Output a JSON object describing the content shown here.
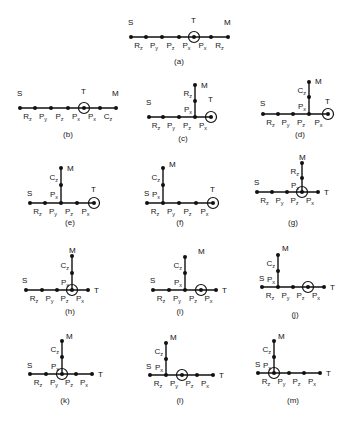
{
  "figures": [
    {
      "id": "a",
      "caption": "(a)",
      "y": 37,
      "xs": [
        131,
        146,
        162,
        179,
        194,
        211,
        228
      ],
      "target_index": 4,
      "labels": [
        [
          "R",
          "z"
        ],
        [
          "P",
          "y"
        ],
        [
          "P",
          "z"
        ],
        [
          "P",
          "x"
        ],
        [
          "P",
          "x"
        ],
        [
          "R",
          "z"
        ]
      ],
      "S": [
        128,
        25
      ],
      "T": [
        191,
        23
      ],
      "M": [
        224,
        25
      ],
      "cap_pos": [
        179,
        64
      ],
      "vertical": null
    },
    {
      "id": "b",
      "caption": "(b)",
      "y": 108,
      "xs": [
        20,
        35,
        51,
        68,
        84,
        100,
        116
      ],
      "target_index": 4,
      "labels": [
        [
          "R",
          "z"
        ],
        [
          "P",
          "y"
        ],
        [
          "P",
          "z"
        ],
        [
          "P",
          "x"
        ],
        [
          "P",
          "x"
        ],
        [
          "C",
          "z"
        ]
      ],
      "S": [
        17,
        96
      ],
      "T": [
        81,
        94
      ],
      "M": [
        112,
        96
      ],
      "cap_pos": [
        68,
        137
      ],
      "vertical": null
    },
    {
      "id": "c",
      "caption": "(c)",
      "y": 117,
      "xs": [
        149,
        163,
        179,
        195,
        211
      ],
      "target_index": 4,
      "labels": [
        [
          "R",
          "z"
        ],
        [
          "P",
          "y"
        ],
        [
          "P",
          "z"
        ],
        [
          "P",
          "x"
        ]
      ],
      "S": [
        146,
        105
      ],
      "T": [
        208,
        102
      ],
      "M": [
        201,
        88
      ],
      "cap_pos": [
        183,
        141
      ],
      "vertical": {
        "x": 195,
        "ys": [
          117,
          101,
          85
        ],
        "labels": [
          [
            "P",
            "x"
          ],
          [
            "R",
            "z"
          ]
        ]
      }
    },
    {
      "id": "d",
      "caption": "(d)",
      "y": 114,
      "xs": [
        263,
        278,
        293,
        309,
        328
      ],
      "target_index": 4,
      "labels": [
        [
          "R",
          "z"
        ],
        [
          "P",
          "y"
        ],
        [
          "P",
          "z"
        ],
        [
          "P",
          "x"
        ]
      ],
      "S": [
        260,
        106
      ],
      "T": [
        325,
        104
      ],
      "M": [
        315,
        84
      ],
      "cap_pos": [
        300,
        137
      ],
      "vertical": {
        "x": 309,
        "ys": [
          114,
          97,
          82
        ],
        "labels": [
          [
            "P",
            "x"
          ],
          [
            "C",
            "z"
          ]
        ]
      }
    },
    {
      "id": "e",
      "caption": "(e)",
      "y": 203,
      "xs": [
        30,
        45,
        61,
        77,
        94
      ],
      "target_index": 4,
      "labels": [
        [
          "R",
          "z"
        ],
        [
          "P",
          "y"
        ],
        [
          "P",
          "z"
        ],
        [
          "P",
          "x"
        ]
      ],
      "S": [
        27,
        196
      ],
      "T": [
        91,
        192
      ],
      "M": [
        67,
        171
      ],
      "cap_pos": [
        70,
        225
      ],
      "vertical": {
        "x": 61,
        "ys": [
          203,
          185,
          168
        ],
        "labels": [
          [
            "P",
            "x"
          ],
          [
            "C",
            "z"
          ]
        ]
      }
    },
    {
      "id": "f",
      "caption": "(f)",
      "y": 203,
      "xs": [
        147,
        163,
        179,
        196,
        213
      ],
      "target_index": 4,
      "labels": [
        [
          "R",
          "z"
        ],
        [
          "P",
          "y"
        ],
        [
          "P",
          "z"
        ],
        [
          "P",
          "x"
        ]
      ],
      "S": [
        144,
        196
      ],
      "T": [
        210,
        192
      ],
      "M": [
        169,
        167
      ],
      "cap_pos": [
        180,
        225
      ],
      "vertical": {
        "x": 163,
        "ys": [
          203,
          185,
          168
        ],
        "labels": [
          [
            "P",
            "x"
          ],
          [
            "C",
            "z"
          ]
        ]
      }
    },
    {
      "id": "g",
      "caption": "(g)",
      "y": 192,
      "xs": [
        257,
        272,
        287,
        302,
        318
      ],
      "target_index": 3,
      "labels": [
        [
          "R",
          "z"
        ],
        [
          "P",
          "y"
        ],
        [
          "P",
          "z"
        ],
        [
          "P",
          "x"
        ]
      ],
      "S": [
        254,
        185
      ],
      "T": [
        324,
        195
      ],
      "M": [
        299,
        160
      ],
      "cap_pos": [
        293,
        225
      ],
      "vertical": {
        "x": 302,
        "ys": [
          192,
          178,
          163
        ],
        "labels": [
          [
            "P",
            "x"
          ],
          [
            "R",
            "z"
          ]
        ]
      }
    },
    {
      "id": "h",
      "caption": "(h)",
      "y": 290,
      "xs": [
        26,
        42,
        57,
        72,
        88
      ],
      "target_index": 3,
      "labels": [
        [
          "R",
          "z"
        ],
        [
          "P",
          "y"
        ],
        [
          "P",
          "z"
        ],
        [
          "P",
          "x"
        ]
      ],
      "S": [
        22,
        283
      ],
      "T": [
        94,
        293
      ],
      "M": [
        69,
        253
      ],
      "cap_pos": [
        70,
        314
      ],
      "vertical": {
        "x": 72,
        "ys": [
          290,
          273,
          256
        ],
        "labels": [
          [
            "P",
            "x"
          ],
          [
            "C",
            "z"
          ]
        ]
      }
    },
    {
      "id": "i",
      "caption": "(i)",
      "y": 290,
      "xs": [
        153,
        169,
        185,
        201,
        216
      ],
      "target_index": 3,
      "labels": [
        [
          "R",
          "z"
        ],
        [
          "P",
          "y"
        ],
        [
          "P",
          "z"
        ],
        [
          "P",
          "x"
        ]
      ],
      "S": [
        150,
        283
      ],
      "T": [
        222,
        293
      ],
      "M": [
        198,
        254
      ],
      "cap_pos": [
        180,
        314
      ],
      "vertical": {
        "x": 185,
        "ys": [
          290,
          273,
          257
        ],
        "labels": [
          [
            "P",
            "x"
          ],
          [
            "C",
            "z"
          ]
        ]
      }
    },
    {
      "id": "j",
      "caption": "(j)",
      "y": 287,
      "xs": [
        262,
        278,
        293,
        308,
        324
      ],
      "target_index": 3,
      "labels": [
        [
          "R",
          "z"
        ],
        [
          "P",
          "y"
        ],
        [
          "P",
          "z"
        ],
        [
          "P",
          "x"
        ]
      ],
      "S": [
        259,
        281
      ],
      "T": [
        330,
        290
      ],
      "M": [
        282,
        251
      ],
      "cap_pos": [
        295,
        317
      ],
      "vertical": {
        "x": 278,
        "ys": [
          287,
          271,
          255
        ],
        "labels": [
          [
            "P",
            "x"
          ],
          [
            "C",
            "z"
          ]
        ]
      }
    },
    {
      "id": "k",
      "caption": "(k)",
      "y": 374,
      "xs": [
        30,
        46,
        62,
        76,
        92
      ],
      "target_index": 2,
      "labels": [
        [
          "R",
          "z"
        ],
        [
          "P",
          "y"
        ],
        [
          "P",
          "z"
        ],
        [
          "P",
          "x"
        ]
      ],
      "S": [
        27,
        368
      ],
      "T": [
        98,
        377
      ],
      "M": [
        66,
        339
      ],
      "cap_pos": [
        65,
        403
      ],
      "vertical": {
        "x": 62,
        "ys": [
          374,
          357,
          341
        ],
        "labels": [
          [
            "P",
            "x"
          ],
          [
            "C",
            "z"
          ]
        ]
      }
    },
    {
      "id": "l",
      "caption": "(l)",
      "y": 375,
      "xs": [
        150,
        166,
        182,
        197,
        213
      ],
      "target_index": 2,
      "labels": [
        [
          "R",
          "z"
        ],
        [
          "P",
          "y"
        ],
        [
          "P",
          "z"
        ],
        [
          "P",
          "x"
        ]
      ],
      "S": [
        146,
        369
      ],
      "T": [
        219,
        378
      ],
      "M": [
        170,
        340
      ],
      "cap_pos": [
        180,
        403
      ],
      "vertical": {
        "x": 166,
        "ys": [
          375,
          359,
          343
        ],
        "labels": [
          [
            "P",
            "x"
          ],
          [
            "C",
            "z"
          ]
        ]
      }
    },
    {
      "id": "m",
      "caption": "(m)",
      "y": 373,
      "xs": [
        258,
        274,
        289,
        304,
        320
      ],
      "target_index": 1,
      "labels": [
        [
          "R",
          "z"
        ],
        [
          "P",
          "y"
        ],
        [
          "P",
          "z"
        ],
        [
          "P",
          "x"
        ]
      ],
      "S": [
        255,
        367
      ],
      "T": [
        326,
        376
      ],
      "M": [
        278,
        339
      ],
      "cap_pos": [
        293,
        403
      ],
      "vertical": {
        "x": 274,
        "ys": [
          373,
          357,
          341
        ],
        "labels": [
          [
            "P",
            "x"
          ],
          [
            "C",
            "z"
          ]
        ]
      }
    }
  ],
  "endpoint_labels": {
    "source": "S",
    "target": "T",
    "end": "M"
  },
  "colors": {
    "ink": "#111111",
    "background": "#ffffff"
  }
}
